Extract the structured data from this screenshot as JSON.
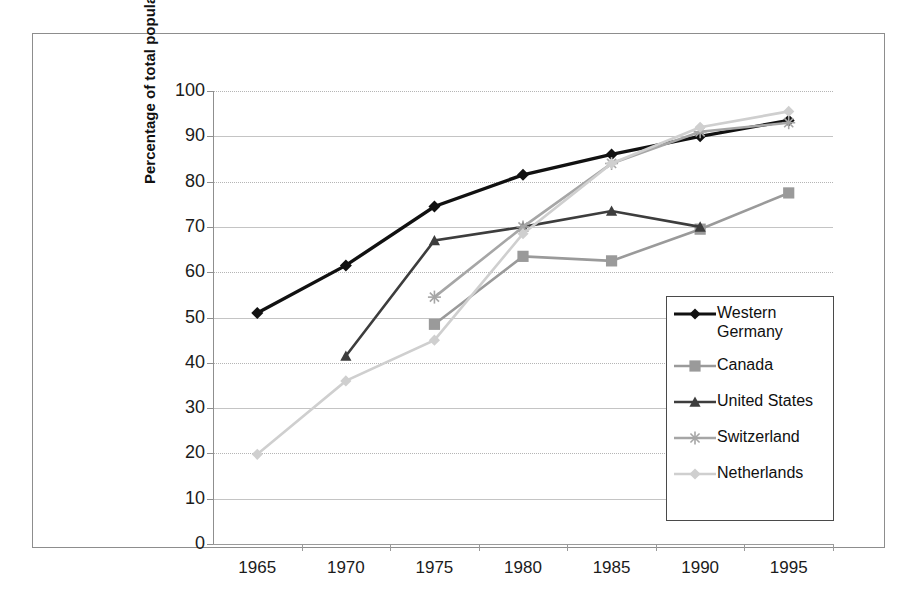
{
  "chart_data": {
    "type": "line",
    "title": "",
    "xlabel": "",
    "ylabel": "Percentage of total population",
    "categories": [
      1965,
      1970,
      1975,
      1980,
      1985,
      1990,
      1995
    ],
    "xtick_labels": [
      "1965",
      "1970",
      "1975",
      "1980",
      "1985",
      "1990",
      "1995"
    ],
    "ytick_labels": [
      "0",
      "10",
      "20",
      "30",
      "40",
      "50",
      "60",
      "70",
      "80",
      "90",
      "100"
    ],
    "ylim": [
      0,
      100
    ],
    "ytick_step": 10,
    "grid": true,
    "legend_position": "inside-right-lower",
    "series": [
      {
        "name": "Western Germany",
        "legend_label": "Western\nGermany",
        "color": "#111111",
        "marker": "diamond",
        "values": [
          51,
          61.5,
          74.5,
          81.5,
          86,
          90,
          93.5
        ]
      },
      {
        "name": "Canada",
        "legend_label": "Canada",
        "color": "#9a9a9a",
        "marker": "square",
        "values": [
          null,
          null,
          48.5,
          63.5,
          62.5,
          69.5,
          77.5
        ]
      },
      {
        "name": "United States",
        "legend_label": "United States",
        "color": "#3d3d3d",
        "marker": "triangle",
        "values": [
          null,
          41.5,
          67,
          70,
          73.5,
          70,
          null
        ]
      },
      {
        "name": "Switzerland",
        "legend_label": "Switzerland",
        "color": "#a6a6a6",
        "marker": "asterisk",
        "values": [
          null,
          null,
          54.5,
          70,
          84,
          91,
          93
        ]
      },
      {
        "name": "Netherlands",
        "legend_label": "Netherlands",
        "color": "#cfcfcf",
        "marker": "diamond",
        "values": [
          19.8,
          36,
          45,
          68.5,
          84,
          92,
          95.5
        ]
      }
    ]
  }
}
